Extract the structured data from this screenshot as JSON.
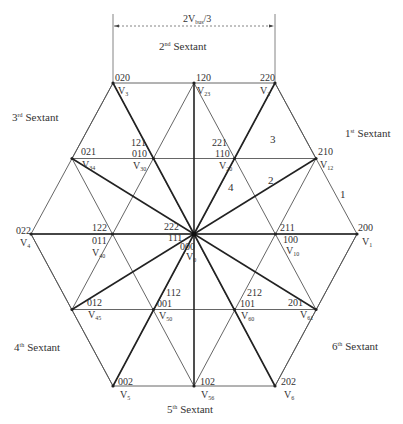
{
  "dimension": {
    "label_main": "2V",
    "label_sub": "bus",
    "label_tail": "/3"
  },
  "sextants": {
    "s1": {
      "num": "1",
      "sup": "st",
      "word": "Sextant"
    },
    "s2": {
      "num": "2",
      "sup": "nd",
      "word": "Sextant"
    },
    "s3": {
      "num": "3",
      "sup": "rd",
      "word": "Sextant"
    },
    "s4": {
      "num": "4",
      "sup": "th",
      "word": "Sextant"
    },
    "s5": {
      "num": "5",
      "sup": "th",
      "word": "Sextant"
    },
    "s6": {
      "num": "6",
      "sup": "th",
      "word": "Sextant"
    }
  },
  "regions": [
    "1",
    "2",
    "3",
    "4"
  ],
  "vectors": {
    "v0": {
      "states": [
        "222",
        "111",
        "000"
      ],
      "name": "V",
      "sub": "0"
    },
    "v1": {
      "states": [
        "200"
      ],
      "name": "V",
      "sub": "1"
    },
    "v2": {
      "states": [
        "220"
      ],
      "name": "V",
      "sub": "2"
    },
    "v3": {
      "states": [
        "020"
      ],
      "name": "V",
      "sub": "3"
    },
    "v4": {
      "states": [
        "022"
      ],
      "name": "V",
      "sub": "4"
    },
    "v5": {
      "states": [
        "002"
      ],
      "name": "V",
      "sub": "5"
    },
    "v6": {
      "states": [
        "202"
      ],
      "name": "V",
      "sub": "6"
    },
    "v12": {
      "states": [
        "210"
      ],
      "name": "V",
      "sub": "12"
    },
    "v23": {
      "states": [
        "120"
      ],
      "name": "V",
      "sub": "23"
    },
    "v34": {
      "states": [
        "021"
      ],
      "name": "V",
      "sub": "34"
    },
    "v45": {
      "states": [
        "012"
      ],
      "name": "V",
      "sub": "45"
    },
    "v56": {
      "states": [
        "102"
      ],
      "name": "V",
      "sub": "56"
    },
    "v61": {
      "states": [
        "201"
      ],
      "name": "V",
      "sub": "61"
    },
    "v10": {
      "states": [
        "211",
        "100"
      ],
      "name": "V",
      "sub": "10"
    },
    "v20": {
      "states": [
        "221",
        "110"
      ],
      "name": "V",
      "sub": "20"
    },
    "v30": {
      "states": [
        "121",
        "010"
      ],
      "name": "V",
      "sub": "30"
    },
    "v40": {
      "states": [
        "122",
        "011"
      ],
      "name": "V",
      "sub": "40"
    },
    "v50": {
      "states": [
        "112",
        "001"
      ],
      "name": "V",
      "sub": "50"
    },
    "v60": {
      "states": [
        "212",
        "101"
      ],
      "name": "V",
      "sub": "60"
    }
  }
}
